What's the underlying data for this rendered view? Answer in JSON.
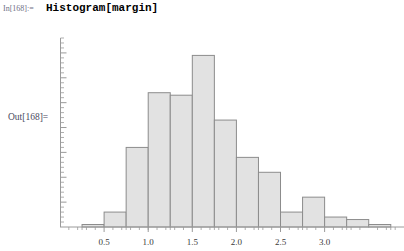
{
  "notebook": {
    "in_label": "In[168]:=",
    "in_code": "Histogram[margin]",
    "out_label": "Out[168]="
  },
  "style": {
    "bar_fill": "#e2e2e2",
    "bar_stroke": "#8c8c8c",
    "axis_color": "#9a9a9a",
    "tick_color": "#9a9a9a",
    "label_color": "#3a3a3a"
  },
  "chart_data": {
    "type": "bar",
    "title": "",
    "xlabel": "",
    "ylabel": "",
    "bin_width": 0.25,
    "bin_starts": [
      0.25,
      0.5,
      0.75,
      1.0,
      1.25,
      1.5,
      1.75,
      2.0,
      2.25,
      2.5,
      2.75,
      3.0,
      3.25,
      3.5
    ],
    "categories": [
      "0.25-0.50",
      "0.50-0.75",
      "0.75-1.00",
      "1.00-1.25",
      "1.25-1.50",
      "1.50-1.75",
      "1.75-2.00",
      "2.00-2.25",
      "2.25-2.50",
      "2.50-2.75",
      "2.75-3.00",
      "3.00-3.25",
      "3.25-3.50",
      "3.50-3.75"
    ],
    "values": [
      1,
      6,
      32,
      54,
      53,
      69,
      43,
      28,
      22,
      6,
      12,
      4,
      3,
      1
    ],
    "xlim": [
      0.0,
      3.9
    ],
    "ylim": [
      0,
      76
    ],
    "xticks": [
      0.5,
      1.0,
      1.5,
      2.0,
      2.5,
      3.0
    ],
    "xtick_labels": [
      "0.5",
      "1.0",
      "1.5",
      "2.0",
      "2.5",
      "3.0"
    ],
    "yticks": [
      10,
      20,
      30,
      40,
      50,
      60,
      70
    ],
    "ytick_labels": [
      "10",
      "20",
      "30",
      "40",
      "50",
      "60",
      "70"
    ],
    "x_minor_step": 0.1,
    "y_minor_step": 2,
    "grid": false,
    "legend": "none"
  }
}
